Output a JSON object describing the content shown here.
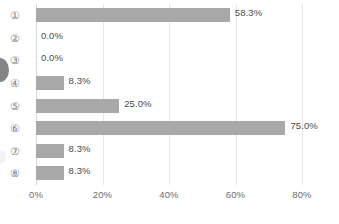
{
  "chart_data": {
    "type": "bar",
    "orientation": "horizontal",
    "title": "",
    "xlabel": "",
    "ylabel": "",
    "categories": [
      "①",
      "②",
      "③",
      "④",
      "⑤",
      "⑥",
      "⑦",
      "⑧"
    ],
    "values": [
      58.3,
      0.0,
      0.0,
      8.3,
      25.0,
      75.0,
      8.3,
      8.3
    ],
    "data_labels": [
      "58.3%",
      "0.0%",
      "0.0%",
      "8.3%",
      "25.0%",
      "75.0%",
      "8.3%",
      "8.3%"
    ],
    "xlim": [
      0,
      80
    ],
    "xticks": [
      0,
      20,
      40,
      60,
      80
    ],
    "xtick_labels": [
      "0%",
      "20%",
      "40%",
      "60%",
      "80%"
    ],
    "grid": "vertical",
    "legend": "none",
    "colors": {
      "bar": "#a8a8a8",
      "gridline": "#e6e6e6",
      "axis": "#d9d9d9",
      "data_label_text": "#4a4a4a",
      "tick_text": "#6d6d6d",
      "category_text": "#7d7d7d",
      "background": "#ffffff"
    }
  }
}
